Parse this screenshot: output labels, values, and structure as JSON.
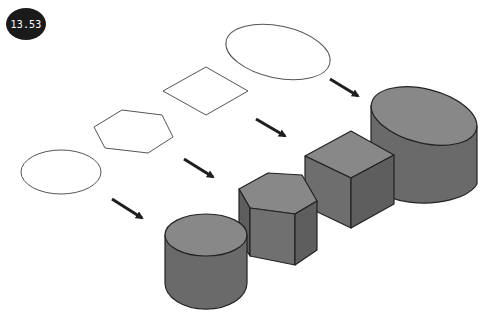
{
  "badge": {
    "label": "13.53",
    "bg": "#1a1a1a",
    "fg": "#ffffff"
  },
  "diagram": {
    "outline_shapes": [
      {
        "name": "circle",
        "type": "ellipse"
      },
      {
        "name": "hexagon",
        "type": "polygon"
      },
      {
        "name": "square",
        "type": "polygon"
      },
      {
        "name": "ellipse",
        "type": "ellipse"
      }
    ],
    "solids": [
      {
        "name": "cylinder"
      },
      {
        "name": "hexagonal-prism"
      },
      {
        "name": "cube"
      },
      {
        "name": "elliptical-cylinder"
      }
    ],
    "arrows_count": 4,
    "colors": {
      "outline": "#555555",
      "solid_top": "#8a8a8a",
      "solid_front": "#6e6e6e",
      "solid_side": "#5e5e5e",
      "edge": "#222222",
      "arrow": "#1e1e1e"
    }
  }
}
